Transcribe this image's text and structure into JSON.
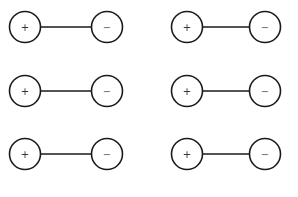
{
  "diagram": {
    "type": "dipole-pairs",
    "radius": 15.5,
    "pairs": [
      {
        "plus": {
          "x": 25,
          "y": 27,
          "label": "+"
        },
        "minus": {
          "x": 107,
          "y": 27,
          "label": "−"
        }
      },
      {
        "plus": {
          "x": 187,
          "y": 27,
          "label": "+"
        },
        "minus": {
          "x": 265,
          "y": 27,
          "label": "−"
        }
      },
      {
        "plus": {
          "x": 25,
          "y": 91,
          "label": "+"
        },
        "minus": {
          "x": 107,
          "y": 91,
          "label": "−"
        }
      },
      {
        "plus": {
          "x": 187,
          "y": 91,
          "label": "+"
        },
        "minus": {
          "x": 265,
          "y": 91,
          "label": "−"
        }
      },
      {
        "plus": {
          "x": 25,
          "y": 154,
          "label": "+"
        },
        "minus": {
          "x": 107,
          "y": 154,
          "label": "−"
        }
      },
      {
        "plus": {
          "x": 187,
          "y": 154,
          "label": "+"
        },
        "minus": {
          "x": 265,
          "y": 154,
          "label": "−"
        }
      }
    ],
    "colors": {
      "stroke": "#1a1a1a",
      "background": "#ffffff"
    }
  }
}
